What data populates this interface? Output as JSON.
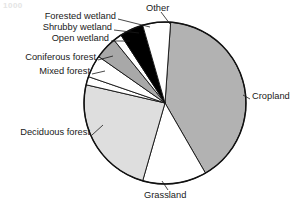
{
  "figure": {
    "corner_mark": "1000",
    "background_color": "#ffffff",
    "outline_color": "#111111"
  },
  "chart_data": {
    "type": "pie",
    "title": "",
    "subtitle": "",
    "xlabel": "",
    "ylabel": "",
    "legend_position": "external-labels-with-leader-lines",
    "grid": false,
    "label_units": "percent of total area",
    "start_angle_deg": 4,
    "direction": "clockwise",
    "center": {
      "x": 165,
      "y": 103
    },
    "radius": 81,
    "categories": [
      "Cropland",
      "Grassland",
      "Deciduous forest",
      "Mixed forest",
      "Coniferous forest",
      "Open wetland",
      "Shrubby wetland",
      "Forested wetland",
      "Other"
    ],
    "values": [
      40.5,
      12.8,
      24.2,
      1.7,
      4.4,
      4.4,
      1.7,
      4.7,
      5.6
    ],
    "colors": [
      "#b2b2b2",
      "#ffffff",
      "#dedede",
      "#ffffff",
      "#ffffff",
      "#a8a8a8",
      "#ffffff",
      "#000000",
      "#ffffff"
    ],
    "slices": [
      {
        "label": "Cropland",
        "value": 40.5,
        "color": "#b2b2b2",
        "start_deg": 4,
        "end_deg": 150
      },
      {
        "label": "Grassland",
        "value": 12.8,
        "color": "#ffffff",
        "start_deg": 150,
        "end_deg": 196
      },
      {
        "label": "Deciduous forest",
        "value": 24.2,
        "color": "#dedede",
        "start_deg": 196,
        "end_deg": 283
      },
      {
        "label": "Mixed forest",
        "value": 1.7,
        "color": "#ffffff",
        "start_deg": 283,
        "end_deg": 289
      },
      {
        "label": "Coniferous forest",
        "value": 4.4,
        "color": "#ffffff",
        "start_deg": 289,
        "end_deg": 305
      },
      {
        "label": "Open wetland",
        "value": 4.4,
        "color": "#a8a8a8",
        "start_deg": 305,
        "end_deg": 321
      },
      {
        "label": "Shrubby wetland",
        "value": 1.7,
        "color": "#ffffff",
        "start_deg": 321,
        "end_deg": 327
      },
      {
        "label": "Forested wetland",
        "value": 4.7,
        "color": "#000000",
        "start_deg": 327,
        "end_deg": 344
      },
      {
        "label": "Other",
        "value": 5.6,
        "color": "#ffffff",
        "start_deg": 344,
        "end_deg": 364
      }
    ]
  },
  "labels": {
    "other": {
      "text": "Other",
      "x": 146,
      "y": 9,
      "anchor": "start"
    },
    "forested_wetland": {
      "text": "Forested wetland",
      "x": 116,
      "y": 17,
      "anchor": "end"
    },
    "shrubby_wetland": {
      "text": "Shrubby wetland",
      "x": 112,
      "y": 28,
      "anchor": "end"
    },
    "open_wetland": {
      "text": "Open wetland",
      "x": 109,
      "y": 39,
      "anchor": "end"
    },
    "coniferous_forest": {
      "text": "Coniferous forest",
      "x": 96,
      "y": 58,
      "anchor": "end"
    },
    "mixed_forest": {
      "text": "Mixed forest",
      "x": 90,
      "y": 72,
      "anchor": "end"
    },
    "deciduous_forest": {
      "text": "Deciduous forest",
      "x": 90,
      "y": 133,
      "anchor": "end"
    },
    "grassland": {
      "text": "Grassland",
      "x": 144,
      "y": 196,
      "anchor": "start"
    },
    "cropland": {
      "text": "Cropland",
      "x": 252,
      "y": 97,
      "anchor": "start"
    }
  }
}
